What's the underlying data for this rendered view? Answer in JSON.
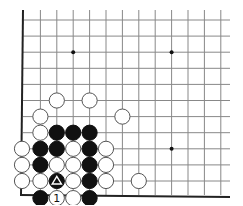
{
  "board": {
    "description": "Go problem diagram, lower-left corner of board",
    "origin_x": 24,
    "origin_y": 20,
    "spacing_x": 16.4,
    "spacing_y": 16.1,
    "columns": 13,
    "rows": 12,
    "line_extent_right": 230,
    "line_top": 10,
    "bottom_edge_y": 195,
    "left_edge_x": 23,
    "colors": {
      "grid": "#888888",
      "edge": "#222222",
      "black_stone": "#111111",
      "white_stone": "#ffffff",
      "stone_outline": "#555555"
    },
    "star_points": [
      {
        "col": 3,
        "row": 2
      },
      {
        "col": 9,
        "row": 2
      },
      {
        "col": 9,
        "row": 8
      }
    ],
    "stones": [
      {
        "col": 2,
        "row": 5,
        "color": "white"
      },
      {
        "col": 4,
        "row": 5,
        "color": "white"
      },
      {
        "col": 1,
        "row": 6,
        "color": "white"
      },
      {
        "col": 6,
        "row": 6,
        "color": "white"
      },
      {
        "col": 1,
        "row": 7,
        "color": "white"
      },
      {
        "col": 2,
        "row": 7,
        "color": "black"
      },
      {
        "col": 3,
        "row": 7,
        "color": "black"
      },
      {
        "col": 4,
        "row": 7,
        "color": "black"
      },
      {
        "col": 0,
        "row": 8,
        "color": "white"
      },
      {
        "col": 1,
        "row": 8,
        "color": "black"
      },
      {
        "col": 2,
        "row": 8,
        "color": "black"
      },
      {
        "col": 3,
        "row": 8,
        "color": "white"
      },
      {
        "col": 4,
        "row": 8,
        "color": "black"
      },
      {
        "col": 5,
        "row": 8,
        "color": "white"
      },
      {
        "col": 0,
        "row": 9,
        "color": "white"
      },
      {
        "col": 1,
        "row": 9,
        "color": "black"
      },
      {
        "col": 2,
        "row": 9,
        "color": "white"
      },
      {
        "col": 3,
        "row": 9,
        "color": "white"
      },
      {
        "col": 4,
        "row": 9,
        "color": "black"
      },
      {
        "col": 5,
        "row": 9,
        "color": "white"
      },
      {
        "col": 0,
        "row": 10,
        "color": "white"
      },
      {
        "col": 1,
        "row": 10,
        "color": "white"
      },
      {
        "col": 2,
        "row": 10,
        "color": "black",
        "mark": "triangle"
      },
      {
        "col": 3,
        "row": 10,
        "color": "white"
      },
      {
        "col": 4,
        "row": 10,
        "color": "black"
      },
      {
        "col": 5,
        "row": 10,
        "color": "white"
      },
      {
        "col": 7,
        "row": 10,
        "color": "white"
      },
      {
        "col": 1,
        "row": 11,
        "color": "black"
      },
      {
        "col": 2,
        "row": 11,
        "color": "white",
        "label": "1"
      },
      {
        "col": 3,
        "row": 11,
        "color": "white"
      },
      {
        "col": 4,
        "row": 11,
        "color": "black"
      }
    ]
  }
}
